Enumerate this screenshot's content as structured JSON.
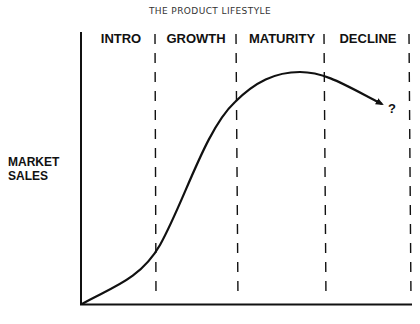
{
  "title": "THE PRODUCT LIFESTYLE",
  "y_axis_label": [
    "MARKET",
    "SALES"
  ],
  "phases": [
    {
      "label": "INTRO"
    },
    {
      "label": "GROWTH"
    },
    {
      "label": "MATURITY"
    },
    {
      "label": "DECLINE"
    }
  ],
  "end_marker": "?",
  "colors": {
    "line": "#111111",
    "text": "#111111",
    "background": "#ffffff"
  }
}
